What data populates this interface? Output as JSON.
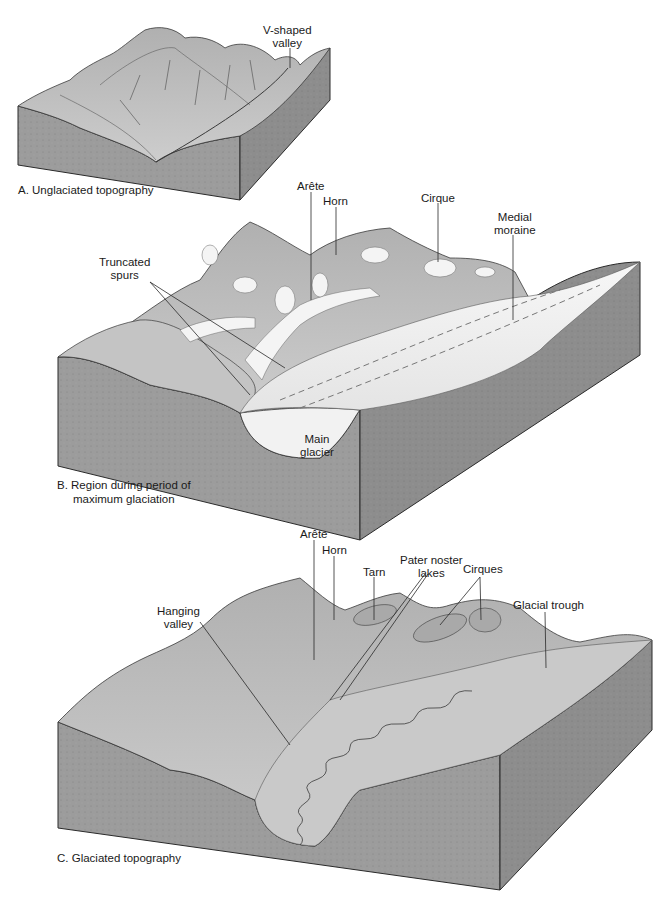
{
  "figure": {
    "panels": [
      {
        "id": "A",
        "caption": "A. Unglaciated topography",
        "labels": [
          {
            "text_lines": [
              "V-shaped",
              "valley"
            ]
          }
        ]
      },
      {
        "id": "B",
        "caption_lines": [
          "B. Region during period of",
          "maximum glaciation"
        ],
        "labels": [
          {
            "text_lines": [
              "Arête"
            ]
          },
          {
            "text_lines": [
              "Horn"
            ]
          },
          {
            "text_lines": [
              "Cirque"
            ]
          },
          {
            "text_lines": [
              "Medial",
              "moraine"
            ]
          },
          {
            "text_lines": [
              "Truncated",
              "spurs"
            ]
          },
          {
            "text_lines": [
              "Main",
              "glacier"
            ]
          }
        ]
      },
      {
        "id": "C",
        "caption": "C. Glaciated topography",
        "labels": [
          {
            "text_lines": [
              "Arête"
            ]
          },
          {
            "text_lines": [
              "Horn"
            ]
          },
          {
            "text_lines": [
              "Tarn"
            ]
          },
          {
            "text_lines": [
              "Pater noster",
              "lakes"
            ]
          },
          {
            "text_lines": [
              "Cirques"
            ]
          },
          {
            "text_lines": [
              "Hanging",
              "valley"
            ]
          },
          {
            "text_lines": [
              "Glacial trough"
            ]
          }
        ]
      }
    ],
    "colors": {
      "block_side": "#9a9a9a",
      "block_side_dark": "#8a8a8a",
      "terrain": "#bdbdbd",
      "terrain_light": "#cfcfcf",
      "ice": "#f2f2f2",
      "outline": "#2a2a2a"
    }
  }
}
